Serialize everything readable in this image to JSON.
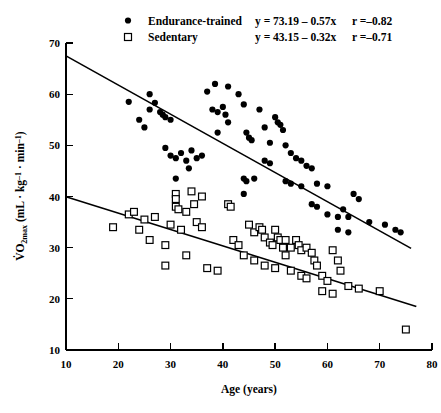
{
  "chart_data": {
    "type": "scatter",
    "title": "",
    "xlabel": "Age (years)",
    "ylabel": "VO2max (mL · kg-1 · min-1)",
    "xlim": [
      10,
      80
    ],
    "ylim": [
      10,
      70
    ],
    "xticks": [
      10,
      20,
      30,
      40,
      50,
      60,
      70,
      80
    ],
    "yticks": [
      10,
      20,
      30,
      40,
      50,
      60,
      70
    ],
    "grid": false,
    "legend_position": "top-center",
    "series": [
      {
        "name": "Endurance-trained",
        "marker": "filled-circle",
        "equation": "y = 73.19 - 0.57x",
        "r": "r =-0.82",
        "slope": -0.57,
        "intercept": 73.19,
        "fit_x": [
          10,
          76
        ],
        "points": [
          [
            22,
            58.5
          ],
          [
            24,
            55.0
          ],
          [
            25,
            53.5
          ],
          [
            26,
            60.0
          ],
          [
            26,
            57.0
          ],
          [
            27,
            58.3
          ],
          [
            28,
            56.5
          ],
          [
            28.5,
            56.0
          ],
          [
            29,
            55.5
          ],
          [
            30,
            55.0
          ],
          [
            29,
            49.5
          ],
          [
            30,
            48.0
          ],
          [
            31,
            47.5
          ],
          [
            32,
            48.5
          ],
          [
            33,
            47.0
          ],
          [
            33.5,
            45.5
          ],
          [
            34,
            49.0
          ],
          [
            35,
            47.5
          ],
          [
            36,
            48.0
          ],
          [
            31,
            43.5
          ],
          [
            37,
            60.5
          ],
          [
            38,
            57.0
          ],
          [
            38.5,
            62.0
          ],
          [
            39,
            56.5
          ],
          [
            40,
            57.5
          ],
          [
            40.5,
            56.0
          ],
          [
            41,
            61.5
          ],
          [
            39,
            52.5
          ],
          [
            41,
            54.5
          ],
          [
            43,
            60.0
          ],
          [
            44,
            58.0
          ],
          [
            44.5,
            52.5
          ],
          [
            45,
            51.5
          ],
          [
            45.5,
            51.0
          ],
          [
            47,
            57.0
          ],
          [
            48,
            53.5
          ],
          [
            49,
            50.5
          ],
          [
            50,
            55.5
          ],
          [
            50.5,
            54.5
          ],
          [
            51,
            54.0
          ],
          [
            51.5,
            53.0
          ],
          [
            48,
            47.0
          ],
          [
            49,
            46.5
          ],
          [
            44,
            43.5
          ],
          [
            44.5,
            43.0
          ],
          [
            46,
            43.5
          ],
          [
            44,
            40.5
          ],
          [
            52,
            50.0
          ],
          [
            53,
            48.5
          ],
          [
            54,
            47.5
          ],
          [
            55,
            47.0
          ],
          [
            56,
            46.0
          ],
          [
            57,
            45.5
          ],
          [
            52,
            43.0
          ],
          [
            53,
            42.5
          ],
          [
            55,
            42.0
          ],
          [
            58,
            42.5
          ],
          [
            60,
            42.0
          ],
          [
            57,
            38.5
          ],
          [
            58,
            38.0
          ],
          [
            60,
            36.5
          ],
          [
            62,
            36.0
          ],
          [
            63,
            37.5
          ],
          [
            64,
            36.0
          ],
          [
            65,
            40.5
          ],
          [
            66,
            39.5
          ],
          [
            62,
            33.5
          ],
          [
            64,
            33.0
          ],
          [
            68,
            35.0
          ],
          [
            71,
            34.5
          ],
          [
            73,
            33.5
          ],
          [
            74,
            33.0
          ]
        ]
      },
      {
        "name": "Sedentary",
        "marker": "open-square",
        "equation": "y = 43.15 - 0.32x",
        "r": "r =-0.71",
        "slope": -0.32,
        "intercept": 43.15,
        "fit_x": [
          10,
          77
        ],
        "points": [
          [
            19,
            34.0
          ],
          [
            22,
            36.5
          ],
          [
            23,
            37.0
          ],
          [
            24,
            33.5
          ],
          [
            25,
            35.5
          ],
          [
            26,
            31.5
          ],
          [
            27,
            36.0
          ],
          [
            29,
            30.5
          ],
          [
            30,
            34.5
          ],
          [
            31,
            40.5
          ],
          [
            31,
            39.5
          ],
          [
            31,
            38.0
          ],
          [
            31.5,
            37.5
          ],
          [
            33,
            37.0
          ],
          [
            34,
            41.0
          ],
          [
            34.5,
            38.5
          ],
          [
            36,
            40.0
          ],
          [
            32,
            33.5
          ],
          [
            33,
            28.5
          ],
          [
            35,
            35.0
          ],
          [
            36,
            34.0
          ],
          [
            29,
            26.5
          ],
          [
            37,
            26.0
          ],
          [
            39,
            25.5
          ],
          [
            41,
            38.5
          ],
          [
            41.5,
            38.0
          ],
          [
            42,
            31.5
          ],
          [
            43,
            30.5
          ],
          [
            45,
            34.5
          ],
          [
            46,
            33.0
          ],
          [
            47,
            34.0
          ],
          [
            47.5,
            33.5
          ],
          [
            48,
            32.0
          ],
          [
            49,
            31.0
          ],
          [
            49.5,
            30.5
          ],
          [
            50,
            33.5
          ],
          [
            50.5,
            32.0
          ],
          [
            51,
            31.5
          ],
          [
            51.5,
            30.0
          ],
          [
            52,
            31.5
          ],
          [
            53,
            30.0
          ],
          [
            44,
            28.5
          ],
          [
            46,
            27.5
          ],
          [
            48,
            26.5
          ],
          [
            50,
            26.0
          ],
          [
            52,
            28.5
          ],
          [
            53,
            25.5
          ],
          [
            54,
            31.5
          ],
          [
            54.5,
            30.5
          ],
          [
            55,
            29.5
          ],
          [
            56,
            30.0
          ],
          [
            57,
            29.0
          ],
          [
            57.5,
            27.5
          ],
          [
            55,
            24.5
          ],
          [
            56,
            24.0
          ],
          [
            58,
            26.5
          ],
          [
            59,
            24.5
          ],
          [
            60,
            23.5
          ],
          [
            61,
            29.5
          ],
          [
            62,
            27.5
          ],
          [
            62.5,
            25.5
          ],
          [
            64,
            22.5
          ],
          [
            66,
            22.0
          ],
          [
            70,
            21.5
          ],
          [
            75,
            14.0
          ],
          [
            59,
            21.5
          ],
          [
            61,
            21.0
          ]
        ]
      }
    ]
  },
  "legend": {
    "rows": [
      {
        "marker": "filled-circle",
        "label": "Endurance-trained",
        "equation": "y = 73.19 – 0.57x",
        "r": "r =–0.82"
      },
      {
        "marker": "open-square",
        "label": "Sedentary",
        "equation": "y = 43.15 – 0.32x",
        "r": "r =–0.71"
      }
    ]
  },
  "axes": {
    "x_title": "Age (years)",
    "y_title_main": "O",
    "y_title_prefix": "V",
    "y_title_sub": "2max",
    "y_title_rest": " (mL · kg",
    "y_title_sup1": "–1",
    "y_title_mid": " · min",
    "y_title_sup2": "–1",
    "y_title_end": ")",
    "x_tick_labels": [
      "10",
      "20",
      "30",
      "40",
      "50",
      "60",
      "70",
      "80"
    ],
    "y_tick_labels": [
      "10",
      "20",
      "30",
      "40",
      "50",
      "60",
      "70"
    ]
  },
  "colors": {
    "foreground": "#000000",
    "background": "#ffffff"
  }
}
